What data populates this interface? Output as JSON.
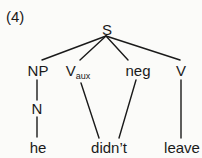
{
  "example_number": "(4)",
  "tree": {
    "root": "S",
    "nodes": {
      "np": "NP",
      "vaux_base": "V",
      "vaux_sub": "aux",
      "neg": "neg",
      "v": "V",
      "n": "N"
    },
    "leaves": {
      "he": "he",
      "didnt": "didn’t",
      "leave": "leave"
    },
    "edges": [
      [
        "S",
        "NP"
      ],
      [
        "S",
        "Vaux"
      ],
      [
        "S",
        "neg"
      ],
      [
        "S",
        "V"
      ],
      [
        "NP",
        "N"
      ],
      [
        "N",
        "he"
      ],
      [
        "Vaux",
        "didn’t"
      ],
      [
        "neg",
        "didn’t"
      ],
      [
        "V",
        "leave"
      ]
    ],
    "line_color": "#1a1a1a"
  }
}
